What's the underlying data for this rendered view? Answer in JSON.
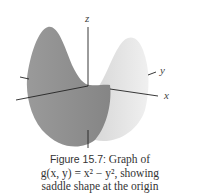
{
  "figure": {
    "axes": {
      "z": "z",
      "y": "y",
      "x": "x"
    },
    "colors": {
      "left_surface": "#8e8e8e",
      "right_surface": "#e6e6e6",
      "axis": "#222222"
    }
  },
  "caption": {
    "label": "Figure 15.7:",
    "line1_rest": " Graph of",
    "line2": "g(x, y) = x² − y², showing",
    "line3": "saddle shape at the origin"
  }
}
